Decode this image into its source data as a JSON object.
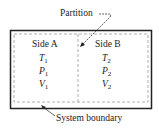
{
  "labels": {
    "partition": "Partition",
    "system_boundary": "System boundary"
  },
  "side_a": {
    "title": "Side A",
    "vars": [
      {
        "sym": "T",
        "sub": "1"
      },
      {
        "sym": "P",
        "sub": "1"
      },
      {
        "sym": "V",
        "sub": "1"
      }
    ]
  },
  "side_b": {
    "title": "Side B",
    "vars": [
      {
        "sym": "T",
        "sub": "2"
      },
      {
        "sym": "P",
        "sub": "2"
      },
      {
        "sym": "V",
        "sub": "2"
      }
    ]
  },
  "colors": {
    "line": "#222222",
    "dashed": "#999999"
  }
}
